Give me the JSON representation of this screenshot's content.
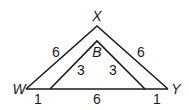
{
  "diagram": {
    "outer_triangle": {
      "vertices": {
        "top": "X",
        "left": "W",
        "right": "Y"
      },
      "side_labels": {
        "WX": "6",
        "XY": "6"
      }
    },
    "inner_triangle": {
      "vertices": {
        "top": "B"
      },
      "side_labels": {
        "left": "3",
        "right": "3"
      }
    },
    "base_segments": [
      "1",
      "6",
      "1"
    ],
    "labels": {
      "X": "X",
      "W": "W",
      "Y": "Y",
      "B": "B",
      "wx": "6",
      "xy": "6",
      "inner_left": "3",
      "inner_right": "3",
      "base_left": "1",
      "base_mid": "6",
      "base_right": "1"
    },
    "stroke_color": "#1a1a1a"
  }
}
